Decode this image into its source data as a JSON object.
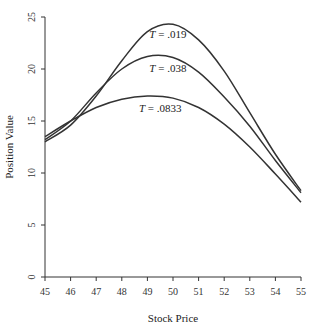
{
  "chart_data": {
    "type": "line",
    "title": "",
    "xlabel": "Stock Price",
    "ylabel": "Position Value",
    "xlim": [
      45,
      55
    ],
    "ylim": [
      0,
      25
    ],
    "grid": false,
    "legend": "none (inline curve labels)",
    "x_ticks": [
      45,
      46,
      47,
      48,
      49,
      50,
      51,
      52,
      53,
      54,
      55
    ],
    "y_ticks": [
      0,
      5,
      10,
      15,
      20,
      25
    ],
    "x": [
      45,
      46,
      47,
      48,
      49,
      50,
      51,
      52,
      53,
      54,
      55
    ],
    "series": [
      {
        "name": "T = .019",
        "label_pos": [
          49.8,
          23.0
        ],
        "values": [
          13.0,
          14.6,
          17.4,
          20.8,
          23.6,
          24.3,
          22.8,
          19.8,
          15.8,
          11.8,
          8.3
        ]
      },
      {
        "name": "T = .038",
        "label_pos": [
          49.8,
          19.7
        ],
        "values": [
          13.2,
          15.0,
          17.7,
          20.0,
          21.2,
          21.1,
          19.7,
          17.3,
          14.5,
          11.2,
          8.1
        ]
      },
      {
        "name": "T = .0833",
        "label_pos": [
          49.5,
          15.9
        ],
        "values": [
          13.5,
          15.0,
          16.3,
          17.1,
          17.4,
          17.2,
          16.3,
          14.7,
          12.5,
          9.9,
          7.2
        ]
      }
    ]
  }
}
